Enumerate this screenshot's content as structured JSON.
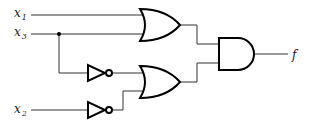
{
  "diagram": {
    "type": "logic-circuit",
    "inputs": [
      {
        "name": "x",
        "sub": "1"
      },
      {
        "name": "x",
        "sub": "3"
      },
      {
        "name": "x",
        "sub": "2"
      }
    ],
    "output": {
      "name": "f"
    },
    "gates": [
      {
        "id": "or1",
        "type": "OR",
        "inputs": [
          "x1",
          "x3"
        ]
      },
      {
        "id": "not1",
        "type": "NOT",
        "inputs": [
          "x3"
        ]
      },
      {
        "id": "not2",
        "type": "NOT",
        "inputs": [
          "x2"
        ]
      },
      {
        "id": "or2",
        "type": "OR",
        "inputs": [
          "not1",
          "not2"
        ]
      },
      {
        "id": "and1",
        "type": "AND",
        "inputs": [
          "or1",
          "or2"
        ],
        "output": "f"
      }
    ],
    "expression": "f = (x1 + x3)(x3' + x2')"
  }
}
